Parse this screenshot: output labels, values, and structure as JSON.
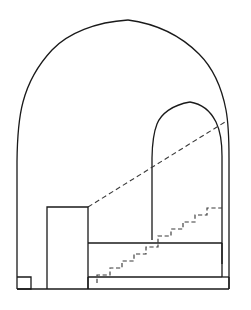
{
  "figure": {
    "title": "Architectural cross-section of a vaulted chamber with staircase",
    "background_color": "#ffffff",
    "line_color": "#1a1a1a",
    "dashed_line_color": "#3a3a3a",
    "canvas": {
      "width": 251,
      "height": 310
    },
    "line_styles": {
      "solid_label": "solid outline",
      "dashed_label": "dashed hidden / projected line"
    }
  },
  "chart_data": {
    "type": "line",
    "title": "Architectural cross-section of a vaulted chamber with staircase",
    "xlabel": "",
    "ylabel": "",
    "xlim": [
      0,
      251
    ],
    "ylim": [
      310,
      0
    ],
    "grid": false,
    "legend": null,
    "series": [
      {
        "name": "outer-pointed-arch-left",
        "style": "solid",
        "points": [
          [
            17,
            289
          ],
          [
            17,
            160
          ],
          [
            17.5,
            128
          ],
          [
            20,
            104
          ],
          [
            26,
            82
          ],
          [
            36,
            62
          ],
          [
            52,
            43
          ],
          [
            72,
            31
          ],
          [
            98,
            25
          ],
          [
            128,
            20
          ]
        ]
      },
      {
        "name": "outer-pointed-arch-right",
        "style": "solid",
        "points": [
          [
            128,
            20
          ],
          [
            158,
            26
          ],
          [
            182,
            38
          ],
          [
            202,
            55
          ],
          [
            216,
            75
          ],
          [
            224,
            96
          ],
          [
            228,
            120
          ],
          [
            229,
            150
          ],
          [
            229,
            289
          ]
        ]
      },
      {
        "name": "inner-pointed-arch-left",
        "style": "solid",
        "points": [
          [
            152,
            238
          ],
          [
            152,
            160
          ],
          [
            152.5,
            146
          ],
          [
            154,
            133
          ],
          [
            158,
            121
          ],
          [
            165,
            112
          ],
          [
            176,
            105
          ],
          [
            190,
            102
          ]
        ]
      },
      {
        "name": "inner-pointed-arch-right",
        "style": "solid",
        "points": [
          [
            190,
            102
          ],
          [
            203,
            106
          ],
          [
            212,
            114
          ],
          [
            218,
            125
          ],
          [
            221,
            139
          ],
          [
            222,
            155
          ],
          [
            222,
            262
          ]
        ]
      },
      {
        "name": "projection-dashed-diagonal",
        "style": "dashed",
        "points": [
          [
            88,
            207
          ],
          [
            225,
            122
          ]
        ]
      },
      {
        "name": "left-pier-block",
        "style": "solid",
        "points": [
          [
            47,
            289
          ],
          [
            47,
            207
          ],
          [
            88,
            207
          ],
          [
            88,
            289
          ]
        ]
      },
      {
        "name": "main-platform",
        "style": "solid",
        "points": [
          [
            88,
            243
          ],
          [
            222,
            243
          ],
          [
            222,
            277
          ],
          [
            88,
            277
          ]
        ]
      },
      {
        "name": "lower-plinth",
        "style": "solid",
        "points": [
          [
            88,
            277
          ],
          [
            229,
            277
          ],
          [
            229,
            289
          ],
          [
            88,
            289
          ]
        ]
      },
      {
        "name": "left-base-notch",
        "style": "solid",
        "points": [
          [
            17,
            277
          ],
          [
            31,
            277
          ],
          [
            31,
            289
          ],
          [
            17,
            289
          ]
        ]
      },
      {
        "name": "ground-line",
        "style": "solid",
        "points": [
          [
            17,
            289
          ],
          [
            229,
            289
          ]
        ]
      },
      {
        "name": "stair-flight-lower",
        "style": "dashed",
        "points": [
          [
            97,
            283
          ],
          [
            97,
            275
          ],
          [
            110,
            275
          ],
          [
            110,
            268
          ],
          [
            122,
            268
          ],
          [
            122,
            261
          ],
          [
            134,
            261
          ],
          [
            134,
            254
          ],
          [
            146,
            254
          ],
          [
            146,
            247
          ],
          [
            158,
            247
          ],
          [
            158,
            243
          ]
        ]
      },
      {
        "name": "stair-flight-upper",
        "style": "dashed",
        "points": [
          [
            158,
            243
          ],
          [
            158,
            236
          ],
          [
            171,
            236
          ],
          [
            171,
            229
          ],
          [
            183,
            229
          ],
          [
            183,
            222
          ],
          [
            195,
            222
          ],
          [
            195,
            215
          ],
          [
            207,
            215
          ],
          [
            207,
            208
          ],
          [
            222,
            208
          ]
        ]
      }
    ]
  },
  "annotations": {
    "elements": [
      {
        "id": "outer-vault",
        "label": "Outer pointed arch / vault profile"
      },
      {
        "id": "inner-vault",
        "label": "Inner pointed arch opening"
      },
      {
        "id": "left-pier",
        "label": "Left pier block"
      },
      {
        "id": "platform",
        "label": "Raised platform"
      },
      {
        "id": "plinth",
        "label": "Lower plinth"
      },
      {
        "id": "staircase",
        "label": "Dashed staircase"
      },
      {
        "id": "sight-line",
        "label": "Dashed projection line"
      }
    ]
  }
}
